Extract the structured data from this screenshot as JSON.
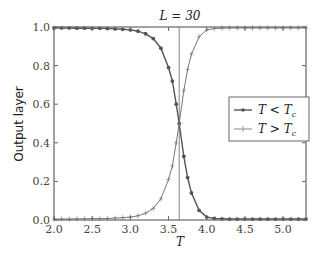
{
  "chart_data": {
    "type": "line",
    "title": "L = 30",
    "xlabel": "T",
    "ylabel": "Output layer",
    "xlim": [
      2.0,
      5.3
    ],
    "ylim": [
      0.0,
      1.0
    ],
    "xticks": [
      "2.0",
      "2.5",
      "3.0",
      "3.5",
      "4.0",
      "4.5",
      "5.0"
    ],
    "yticks": [
      "0.0",
      "0.2",
      "0.4",
      "0.6",
      "0.8",
      "1.0"
    ],
    "critical_T": 3.64,
    "grid": false,
    "legend_position": "center right",
    "x": [
      2.0,
      2.1,
      2.2,
      2.3,
      2.4,
      2.5,
      2.6,
      2.7,
      2.8,
      2.9,
      3.0,
      3.1,
      3.2,
      3.3,
      3.4,
      3.5,
      3.55,
      3.6,
      3.64,
      3.7,
      3.75,
      3.8,
      3.9,
      4.0,
      4.1,
      4.2,
      4.3,
      4.4,
      4.5,
      4.6,
      4.7,
      4.8,
      4.9,
      5.0,
      5.1,
      5.2,
      5.3
    ],
    "series": [
      {
        "name": "T < T_c",
        "marker": "dot",
        "color": "#555555",
        "values": [
          0.995,
          0.995,
          0.995,
          0.994,
          0.994,
          0.993,
          0.993,
          0.992,
          0.99,
          0.988,
          0.985,
          0.978,
          0.965,
          0.94,
          0.89,
          0.79,
          0.72,
          0.6,
          0.5,
          0.33,
          0.22,
          0.14,
          0.05,
          0.015,
          0.008,
          0.006,
          0.005,
          0.005,
          0.005,
          0.005,
          0.005,
          0.005,
          0.005,
          0.005,
          0.005,
          0.005,
          0.005
        ]
      },
      {
        "name": "T > T_c",
        "marker": "plus",
        "color": "#777777",
        "values": [
          0.005,
          0.005,
          0.005,
          0.006,
          0.006,
          0.007,
          0.007,
          0.008,
          0.01,
          0.012,
          0.015,
          0.022,
          0.035,
          0.06,
          0.11,
          0.21,
          0.28,
          0.4,
          0.5,
          0.67,
          0.78,
          0.86,
          0.95,
          0.985,
          0.992,
          0.994,
          0.995,
          0.995,
          0.995,
          0.995,
          0.995,
          0.995,
          0.995,
          0.995,
          0.995,
          0.995,
          0.995
        ]
      }
    ]
  },
  "legend": {
    "items": [
      {
        "label_main": "T < T",
        "sub": "c"
      },
      {
        "label_main": "T > T",
        "sub": "c"
      }
    ]
  }
}
